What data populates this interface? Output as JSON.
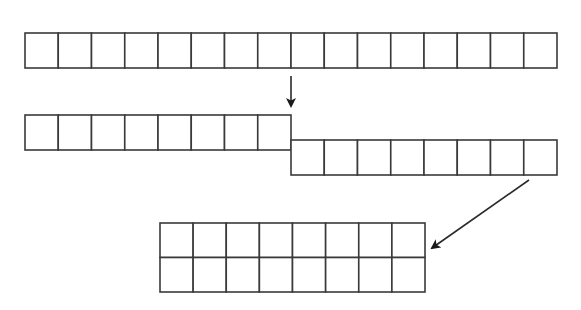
{
  "diagram": {
    "title": "",
    "colors": {
      "stroke": "#3a3a3a",
      "fill": "#ffffff",
      "arrow": "#1a1a1a",
      "background": "#ffffff"
    },
    "stages": [
      {
        "name": "original-row",
        "rows": 1,
        "cols": 16,
        "x": 25,
        "y": 33,
        "cell_w": 33.25,
        "cell_h": 35
      },
      {
        "name": "split-left-half",
        "rows": 1,
        "cols": 8,
        "x": 25,
        "y": 115,
        "cell_w": 33.25,
        "cell_h": 35
      },
      {
        "name": "split-right-half",
        "rows": 1,
        "cols": 8,
        "x": 291,
        "y": 140,
        "cell_w": 33.25,
        "cell_h": 35
      },
      {
        "name": "stacked-grid",
        "rows": 2,
        "cols": 8,
        "x": 160,
        "y": 223,
        "cell_w": 33.125,
        "cell_h": 34.5
      }
    ],
    "arrows": [
      {
        "name": "split-arrow",
        "direction": "down",
        "x1": 291,
        "y1": 76,
        "x2": 291,
        "y2": 106
      },
      {
        "name": "stack-arrow",
        "direction": "down-left",
        "x1": 529,
        "y1": 180,
        "x2": 432,
        "y2": 248
      }
    ]
  }
}
